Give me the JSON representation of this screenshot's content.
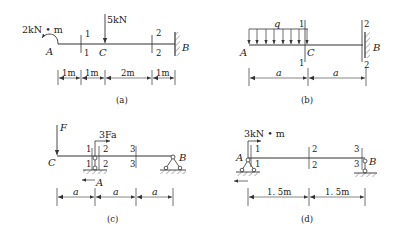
{
  "figures": [
    {
      "id": "a",
      "caption": "(a)",
      "moment_label": "2kN • m",
      "force_label": "5kN",
      "points": {
        "A": "A",
        "C": "C",
        "B": "B"
      },
      "sections": {
        "s1_top": "1",
        "s1_bot": "1",
        "s2_top": "2",
        "s2_bot": "2"
      },
      "dimensions": [
        "1m",
        "1m",
        "2m",
        "1m"
      ]
    },
    {
      "id": "b",
      "caption": "(b)",
      "load_label": "q",
      "points": {
        "A": "A",
        "C": "C",
        "B": "B"
      },
      "sections": {
        "s1_top": "1",
        "s1_bot": "1",
        "s2_top": "2",
        "s2_bot": "2"
      },
      "dimensions": [
        "a",
        "a"
      ]
    },
    {
      "id": "c",
      "caption": "(c)",
      "force_label": "F",
      "moment_label": "3Fa",
      "points": {
        "A": "A",
        "C": "C",
        "B": "B"
      },
      "sections": {
        "s1_top": "1",
        "s1_bot": "1",
        "s2_top": "2",
        "s2_bot": "2",
        "s3_top": "3",
        "s3_bot": "3"
      },
      "dimensions": [
        "a",
        "a",
        "a"
      ]
    },
    {
      "id": "d",
      "caption": "(d)",
      "moment_label": "3kN • m",
      "points": {
        "A": "A",
        "B": "B"
      },
      "sections": {
        "s1_top": "1",
        "s1_bot": "1",
        "s2_top": "2",
        "s2_bot": "2",
        "s3_top": "3",
        "s3_bot": "3"
      },
      "dimensions": [
        "1. 5m",
        "1. 5m"
      ]
    }
  ],
  "colors": {
    "line": "#333333",
    "text": "#222222",
    "background": "#ffffff"
  }
}
